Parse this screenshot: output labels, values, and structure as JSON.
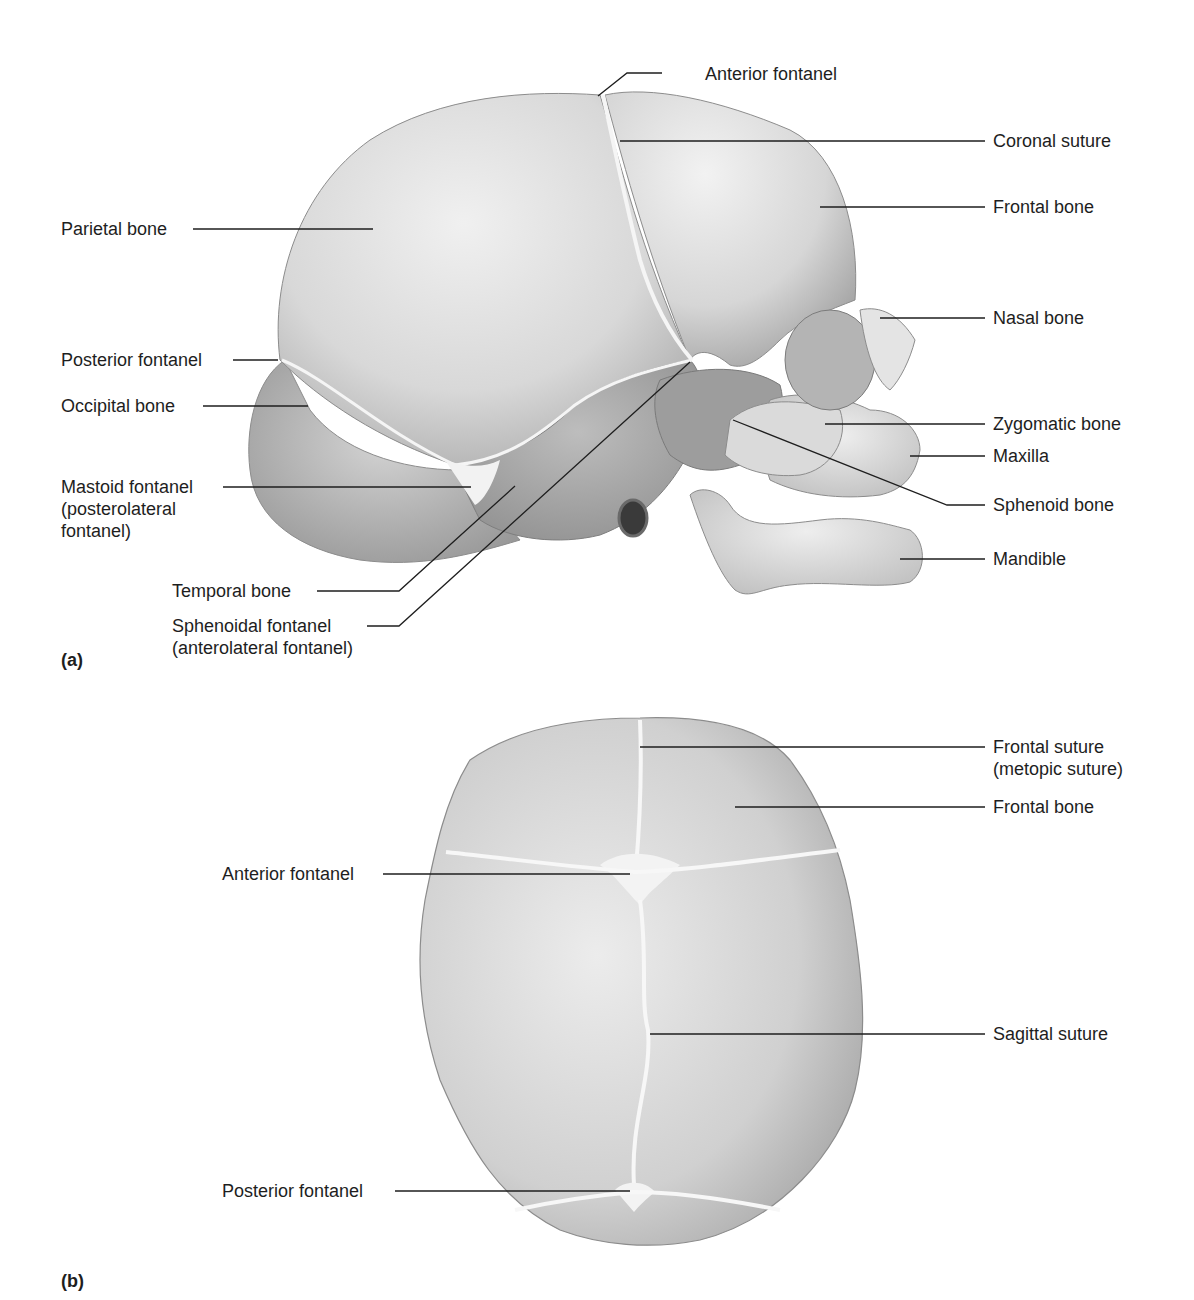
{
  "figure": {
    "panels": [
      {
        "id": "(a)",
        "view": "lateral",
        "labels": {
          "anterior_fontanel": "Anterior fontanel",
          "coronal_suture": "Coronal suture",
          "frontal_bone": "Frontal bone",
          "parietal_bone": "Parietal bone",
          "nasal_bone": "Nasal bone",
          "posterior_fontanel": "Posterior fontanel",
          "occipital_bone": "Occipital bone",
          "zygomatic_bone": "Zygomatic bone",
          "maxilla": "Maxilla",
          "mastoid_fontanel": "Mastoid fontanel\n(posterolateral\nfontanel)",
          "sphenoid_bone": "Sphenoid bone",
          "mandible": "Mandible",
          "temporal_bone": "Temporal bone",
          "sphenoidal_fontanel": "Sphenoidal fontanel\n(anterolateral fontanel)"
        }
      },
      {
        "id": "(b)",
        "view": "superior",
        "labels": {
          "frontal_suture": "Frontal suture\n(metopic suture)",
          "frontal_bone": "Frontal bone",
          "anterior_fontanel": "Anterior fontanel",
          "sagittal_suture": "Sagittal suture",
          "posterior_fontanel": "Posterior fontanel"
        }
      }
    ]
  },
  "colors": {
    "background": "#ffffff",
    "bone_light": "#e6e6e6",
    "bone_mid": "#c9c9c9",
    "bone_dark": "#9a9a9a",
    "suture": "#f4f4f4",
    "leader_line": "#1e1e1e",
    "text": "#1e1e1e"
  }
}
